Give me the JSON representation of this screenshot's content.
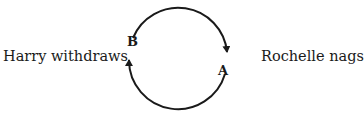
{
  "diagram": {
    "type": "feedback-loop",
    "left_label": "Harry withdraws",
    "right_label": "Rochelle nags",
    "nodes": [
      {
        "id": "B",
        "label": "B",
        "side": "left"
      },
      {
        "id": "A",
        "label": "A",
        "side": "right"
      }
    ],
    "edges": [
      {
        "from": "B",
        "to": "A",
        "path": "upper-arc",
        "direction": "clockwise"
      },
      {
        "from": "A",
        "to": "B",
        "path": "lower-arc",
        "direction": "clockwise"
      }
    ],
    "colors": {
      "stroke": "#1a1a1a",
      "background": "#ffffff"
    }
  }
}
